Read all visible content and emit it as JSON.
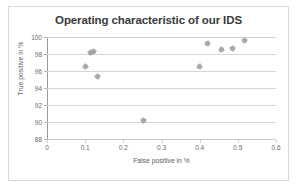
{
  "chart_data": {
    "type": "scatter",
    "title": "Operating characteristic of our IDS",
    "xlabel": "False positive in %",
    "ylabel": "True positive in %",
    "xlim": [
      0,
      0.6
    ],
    "ylim": [
      88,
      100
    ],
    "xticks": [
      "0",
      "0.1",
      "0.2",
      "0.3",
      "0.4",
      "0.5",
      "0.6"
    ],
    "xtick_values": [
      0,
      0.1,
      0.2,
      0.3,
      0.4,
      0.5,
      0.6
    ],
    "yticks": [
      "88",
      "90",
      "92",
      "94",
      "96",
      "98",
      "100"
    ],
    "ytick_values": [
      88,
      90,
      92,
      94,
      96,
      98,
      100
    ],
    "grid": "horizontal",
    "legend": "none",
    "marker_color": "#9a9a9a",
    "series": [
      {
        "name": "IDS operating points",
        "points": [
          {
            "x": 0.1,
            "y": 96.5
          },
          {
            "x": 0.113,
            "y": 98.2
          },
          {
            "x": 0.121,
            "y": 98.3
          },
          {
            "x": 0.133,
            "y": 95.4
          },
          {
            "x": 0.252,
            "y": 90.2
          },
          {
            "x": 0.4,
            "y": 96.5
          },
          {
            "x": 0.421,
            "y": 99.2
          },
          {
            "x": 0.456,
            "y": 98.5
          },
          {
            "x": 0.487,
            "y": 98.7
          },
          {
            "x": 0.517,
            "y": 99.6
          }
        ]
      }
    ]
  }
}
